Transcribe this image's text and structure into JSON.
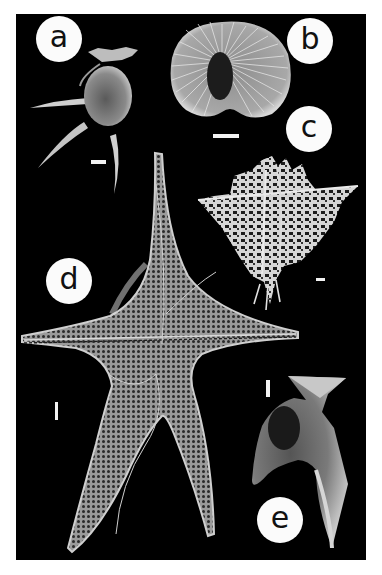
{
  "figure": {
    "background": "#000000",
    "page_background": "#ffffff",
    "panels": [
      {
        "id": "a",
        "label": "a",
        "scale_bar": "horizontal"
      },
      {
        "id": "b",
        "label": "b",
        "scale_bar": "horizontal"
      },
      {
        "id": "c",
        "label": "c",
        "scale_bar": "horizontal"
      },
      {
        "id": "d",
        "label": "d",
        "scale_bar": "vertical"
      },
      {
        "id": "e",
        "label": "e",
        "scale_bar": "vertical"
      }
    ]
  }
}
